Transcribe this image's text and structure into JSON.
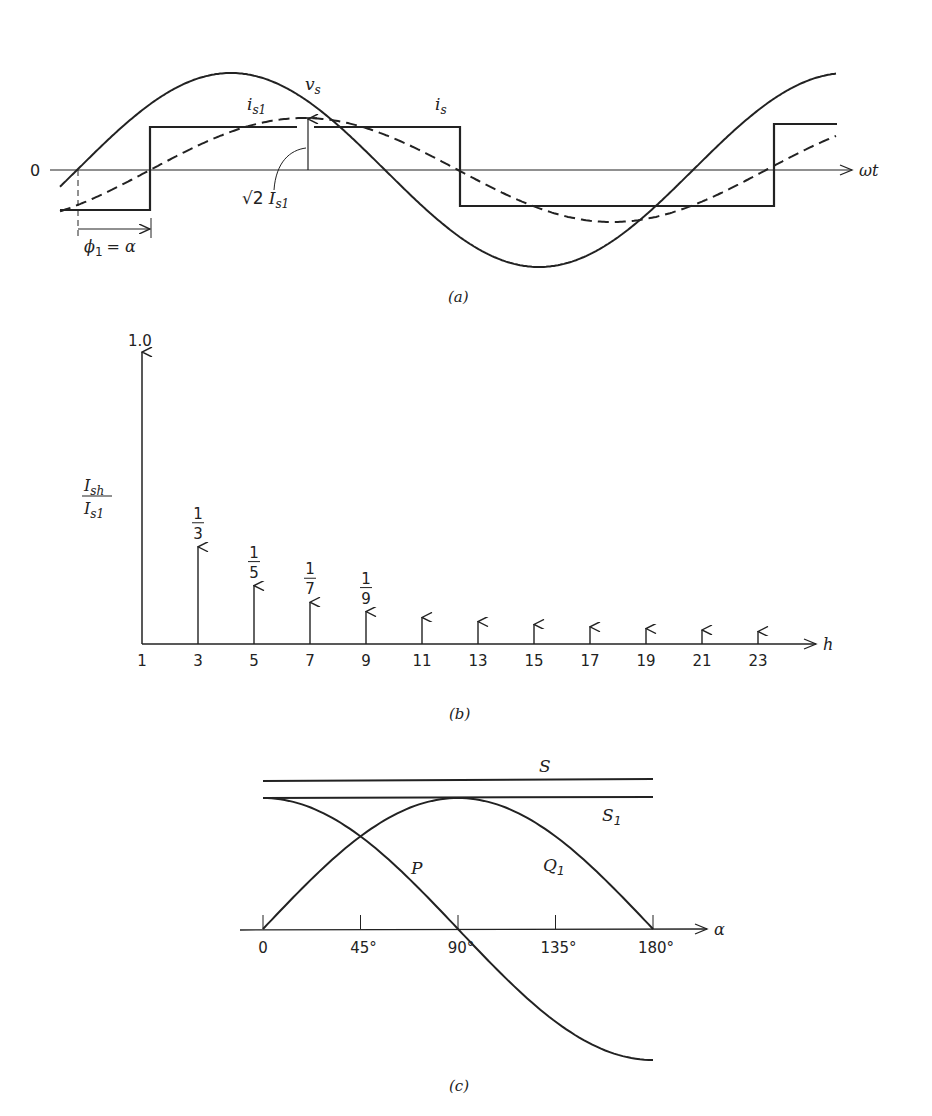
{
  "figure": {
    "panel_a": {
      "caption": "(a)",
      "origin_label": "0",
      "x_axis_label": "ωt",
      "labels": {
        "vs": "v",
        "vs_sub": "s",
        "is1": "i",
        "is1_sub": "s1",
        "is": "i",
        "is_sub": "s",
        "peak_sqrt": "√2",
        "peak_I": "I",
        "peak_sub": "s1",
        "phase_phi": "ϕ",
        "phase_phi_sub": "1",
        "phase_eq": "= α"
      }
    },
    "panel_b": {
      "caption": "(b)",
      "y_top_label": "1.0",
      "y_label_num": "I",
      "y_label_num_sub": "sh",
      "y_label_den": "I",
      "y_label_den_sub": "s1",
      "x_axis_label": "h",
      "fraction_labels": [
        {
          "num": "1",
          "den": "3"
        },
        {
          "num": "1",
          "den": "5"
        },
        {
          "num": "1",
          "den": "7"
        },
        {
          "num": "1",
          "den": "9"
        }
      ],
      "tick_labels": [
        "1",
        "3",
        "5",
        "7",
        "9",
        "11",
        "13",
        "15",
        "17",
        "19",
        "21",
        "23"
      ]
    },
    "panel_c": {
      "caption": "(c)",
      "x_axis_label": "α",
      "tick_labels": [
        "0",
        "45°",
        "90°",
        "135°",
        "180°"
      ],
      "curve_labels": {
        "S": "S",
        "S1": "S",
        "S1_sub": "1",
        "P": "P",
        "Q1": "Q",
        "Q1_sub": "1"
      }
    }
  },
  "chart_data": [
    {
      "type": "line",
      "title": "(a) Line voltage v_s, square-wave current i_s and its fundamental i_s1",
      "xlabel": "ωt",
      "ylabel": "",
      "series": [
        {
          "name": "v_s",
          "shape": "sinusoid",
          "amplitude": 1.0,
          "phase_deg": 0
        },
        {
          "name": "i_s1",
          "shape": "sinusoid (dashed)",
          "amplitude": 0.55,
          "phase_lag_deg": "α",
          "peak_label": "√2 I_s1"
        },
        {
          "name": "i_s",
          "shape": "square wave",
          "amplitude": 0.43,
          "phase_lag_deg": "α"
        }
      ],
      "annotations": [
        "ϕ1 = α",
        "√2 I_s1",
        "0"
      ]
    },
    {
      "type": "bar",
      "title": "(b) Harmonic spectrum of square-wave current",
      "xlabel": "h",
      "ylabel": "I_sh / I_s1",
      "categories": [
        1,
        3,
        5,
        7,
        9,
        11,
        13,
        15,
        17,
        19,
        21,
        23
      ],
      "values": [
        1.0,
        0.333,
        0.2,
        0.143,
        0.111,
        0.091,
        0.077,
        0.067,
        0.059,
        0.053,
        0.048,
        0.043
      ],
      "value_labels": [
        "1.0",
        "1/3",
        "1/5",
        "1/7",
        "1/9",
        "",
        "",
        "",
        "",
        "",
        "",
        ""
      ],
      "ylim": [
        0,
        1.0
      ]
    },
    {
      "type": "line",
      "title": "(c) Powers versus delay angle α",
      "xlabel": "α",
      "ylabel": "",
      "x": [
        0,
        45,
        90,
        135,
        180
      ],
      "series": [
        {
          "name": "S",
          "values": [
            1.11,
            1.11,
            1.11,
            1.11,
            1.11
          ]
        },
        {
          "name": "S1",
          "values": [
            1.0,
            1.0,
            1.0,
            1.0,
            1.0
          ]
        },
        {
          "name": "P",
          "values": [
            1.0,
            0.707,
            0.0,
            -0.707,
            -1.0
          ]
        },
        {
          "name": "Q1",
          "values": [
            0.0,
            0.707,
            1.0,
            0.707,
            0.0
          ]
        }
      ],
      "xlim": [
        0,
        180
      ]
    }
  ]
}
